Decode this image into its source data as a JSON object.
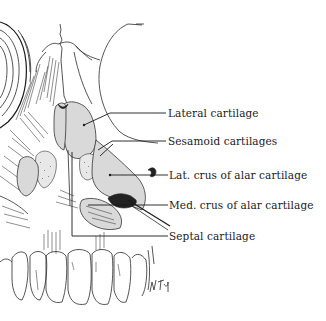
{
  "figure": {
    "labels": [
      {
        "id": "lateral-cartilage",
        "text": "Lateral cartilage"
      },
      {
        "id": "sesamoid-cartilages",
        "text": "Sesamoid cartilages"
      },
      {
        "id": "lat-crus-alar",
        "text": "Lat. crus of alar cartilage"
      },
      {
        "id": "med-crus-alar",
        "text": "Med. crus of alar cartilage"
      },
      {
        "id": "septal-cartilage",
        "text": "Septal cartilage"
      }
    ],
    "signature": "W Toy",
    "colors": {
      "ink": "#1a1a1a",
      "cartilage_fill": "#d9d9d9",
      "background": "#ffffff"
    }
  }
}
